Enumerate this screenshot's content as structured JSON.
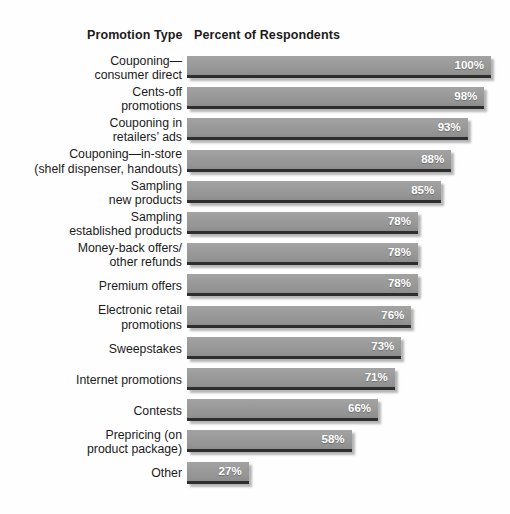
{
  "header": {
    "category_title": "Promotion Type",
    "value_title": "Percent of Respondents"
  },
  "chart_data": {
    "type": "bar",
    "orientation": "horizontal",
    "title": "",
    "subtitle": "",
    "xlabel": "Percent of Respondents",
    "ylabel": "Promotion Type",
    "xlim": [
      0,
      100
    ],
    "grid": false,
    "legend": null,
    "value_suffix": "%",
    "bar_color": "#9a9a9a",
    "value_label_color": "#ffffff",
    "background_color": "#fefefe",
    "categories": [
      "Couponing—\nconsumer direct",
      "Cents-off\npromotions",
      "Couponing in\nretailers’ ads",
      "Couponing—in-store\n(shelf dispenser, handouts)",
      "Sampling\nnew products",
      "Sampling\nestablished products",
      "Money-back offers/\nother refunds",
      "Premium offers",
      "Electronic retail\npromotions",
      "Sweepstakes",
      "Internet promotions",
      "Contests",
      "Prepricing (on\nproduct package)",
      "Other"
    ],
    "values": [
      100,
      98,
      93,
      88,
      85,
      78,
      78,
      78,
      76,
      73,
      71,
      66,
      58,
      27
    ],
    "value_labels": [
      "100%",
      "98%",
      "93%",
      "88%",
      "85%",
      "78%",
      "78%",
      "78%",
      "76%",
      "73%",
      "71%",
      "66%",
      "58%",
      "27%"
    ]
  }
}
